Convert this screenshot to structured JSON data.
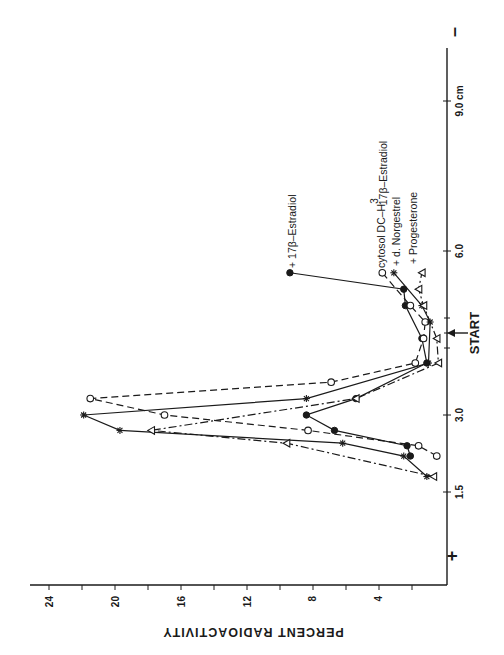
{
  "chart_data": {
    "type": "line",
    "orientation": "rotated 90 degrees clockwise (value axis runs horizontally at bottom, increasing to the left; distance axis runs vertically at right, increasing upward)",
    "title": "",
    "xlabel": "cm",
    "ylabel": "PERCENT RADIOACTIVITY",
    "x_ticks": [
      "1.5",
      "3.0",
      "6.0",
      "9.0 cm"
    ],
    "y_ticks": [
      "4",
      "8",
      "12",
      "16",
      "20",
      "24"
    ],
    "ylim": [
      0,
      25
    ],
    "xlim": [
      0.5,
      9.5
    ],
    "annotations": {
      "start": "START",
      "anode": "+",
      "cathode": "–"
    },
    "legend": [
      {
        "label": "+ 17β–Estradiol",
        "marker": "filled-circle",
        "line": "solid"
      },
      {
        "label": "cytosol DC–H³ 17β–Estradiol",
        "marker": "open-circle",
        "line": "dashed"
      },
      {
        "label": "+ d. Norgestrel",
        "marker": "asterisk",
        "line": "solid"
      },
      {
        "label": "+ Progesterone",
        "marker": "open-triangle",
        "line": "dash-dot"
      }
    ],
    "series": [
      {
        "name": "+ 17β-Estradiol",
        "marker": "filled-circle",
        "x": [
          2.2,
          2.4,
          2.7,
          3.0,
          3.3,
          3.95,
          4.4,
          5.0,
          5.3,
          5.6
        ],
        "values": [
          2.1,
          2.3,
          6.7,
          8.4,
          5.4,
          1.1,
          1.4,
          2.4,
          2.5,
          9.4
        ]
      },
      {
        "name": "cytosol DC-H3 17β-Estradiol",
        "marker": "open-circle",
        "x": [
          2.2,
          2.4,
          2.7,
          3.0,
          3.3,
          3.6,
          3.95,
          4.4,
          4.7,
          5.0,
          5.6
        ],
        "values": [
          0.5,
          1.6,
          8.3,
          17.0,
          21.5,
          6.9,
          1.8,
          1.3,
          1.2,
          2.1,
          3.8
        ]
      },
      {
        "name": "+ d. Norgestrel",
        "marker": "asterisk",
        "x": [
          1.8,
          2.2,
          2.45,
          2.7,
          3.0,
          3.3,
          3.95,
          4.7,
          5.0,
          5.6
        ],
        "values": [
          1.1,
          2.5,
          6.2,
          19.7,
          21.9,
          8.4,
          1.0,
          0.9,
          1.4,
          3.1
        ]
      },
      {
        "name": "+ Progesterone",
        "marker": "open-triangle",
        "x": [
          1.8,
          2.45,
          2.7,
          3.3,
          3.95,
          4.4,
          5.0,
          5.3,
          5.6
        ],
        "values": [
          0.7,
          9.6,
          17.8,
          5.4,
          0.4,
          0.5,
          1.3,
          1.6,
          1.4
        ]
      }
    ]
  },
  "axes": {
    "value_axis": {
      "title": "PERCENT RADIOACTIVITY",
      "ticks": [
        {
          "label": "24",
          "x": 50
        },
        {
          "label": "20",
          "x": 116
        },
        {
          "label": "16",
          "x": 182
        },
        {
          "label": "12",
          "x": 248
        },
        {
          "label": "8",
          "x": 313
        },
        {
          "label": "4",
          "x": 379
        }
      ]
    },
    "distance_axis": {
      "ticks": [
        {
          "label": "9.0 cm",
          "y": 101
        },
        {
          "label": "6.0",
          "y": 251
        },
        {
          "label": "3.0",
          "y": 415
        },
        {
          "label": "1.5",
          "y": 492
        }
      ]
    },
    "start_label": "START",
    "plus_pole": "+",
    "minus_pole": "–"
  },
  "legend": {
    "estradiol": "+ 17β–Estradiol",
    "cytosol_prefix": "cytosol DC–H",
    "cytosol_sup": "3",
    "cytosol_sub": "17β–Estradiol",
    "norgestrel": "+ d. Norgestrel",
    "progesterone": "+ Progesterone"
  }
}
